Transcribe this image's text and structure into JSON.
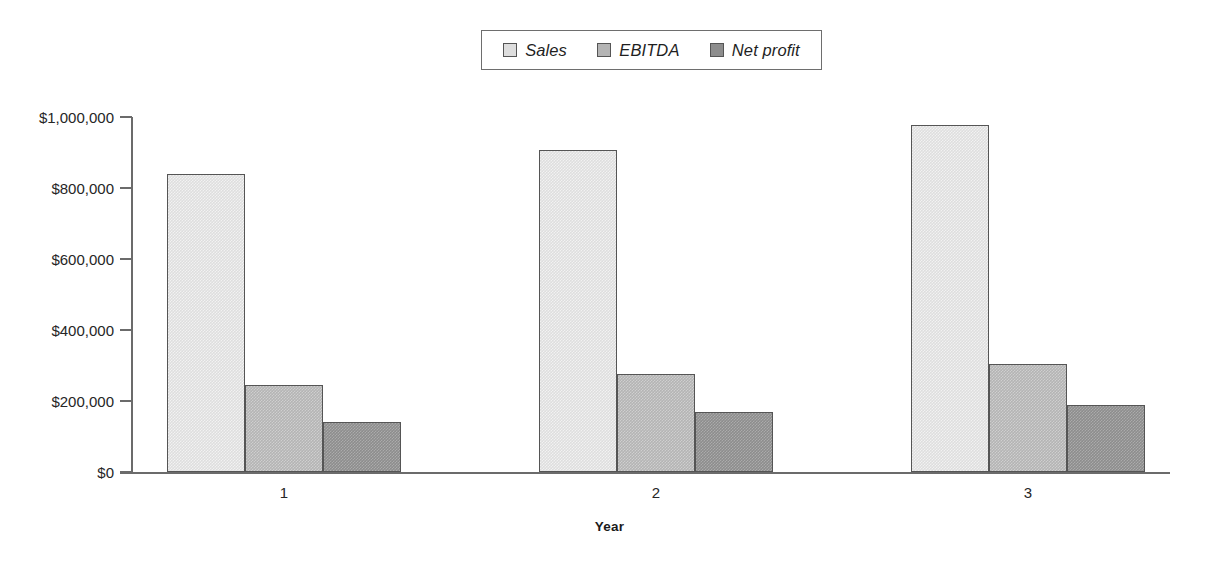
{
  "chart_data": {
    "type": "bar",
    "title": "",
    "subtitle": "",
    "xlabel": "Year",
    "ylabel": "",
    "categories": [
      "1",
      "2",
      "3"
    ],
    "series": [
      {
        "name": "Sales",
        "values": [
          840000,
          907000,
          978000
        ],
        "color": "#dedede"
      },
      {
        "name": "EBITDA",
        "values": [
          245000,
          276000,
          304000
        ],
        "color": "#b4b4b4"
      },
      {
        "name": "Net profit",
        "values": [
          141000,
          169000,
          189000
        ],
        "color": "#8d8d8d"
      }
    ],
    "ylim": [
      0,
      1000000
    ],
    "ytick_values": [
      0,
      200000,
      400000,
      600000,
      800000,
      1000000
    ],
    "ytick_labels": [
      "$0",
      "$200,000",
      "$400,000",
      "$600,000",
      "$800,000",
      "$1,000,000"
    ],
    "grid": false,
    "legend_position": "top-center",
    "legend_entries": [
      "Sales",
      "EBITDA",
      "Net profit"
    ],
    "orientation": "vertical",
    "bar_style": "grouped"
  },
  "axis": {
    "x_title": "Year",
    "y_tick_labels": [
      "$1,000,000",
      "$800,000",
      "$600,000",
      "$400,000",
      "$200,000",
      "$0"
    ],
    "x_tick_labels": [
      "1",
      "2",
      "3"
    ]
  },
  "legend": {
    "entries": [
      {
        "label": "Sales",
        "swatch_color": "#dedede"
      },
      {
        "label": "EBITDA",
        "swatch_color": "#b4b4b4"
      },
      {
        "label": "Net profit",
        "swatch_color": "#8d8d8d"
      }
    ]
  },
  "colors": {
    "sales": "#dedede",
    "ebitda": "#b4b4b4",
    "net_profit": "#8d8d8d",
    "axis": "#6b6b6b",
    "text": "#262626",
    "background": "#ffffff"
  }
}
